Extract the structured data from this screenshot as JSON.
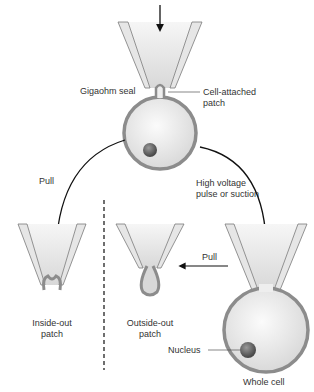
{
  "diagram": {
    "labels": {
      "gigaohm_seal": "Gigaohm seal",
      "cell_attached": [
        "Cell-attached",
        "patch"
      ],
      "pull_left": "Pull",
      "high_voltage": [
        "High voltage",
        "pulse or suction"
      ],
      "pull_middle": "Pull",
      "inside_out": [
        "Inside-out",
        "patch"
      ],
      "outside_out": [
        "Outside-out",
        "patch"
      ],
      "nucleus": "Nucleus",
      "whole_cell": "Whole cell"
    },
    "colors": {
      "glass": "#e2e2e2",
      "glass_edge": "#7a7a7a",
      "membrane": "#8c8c8c",
      "cytoplasm": "#eeeeee",
      "nucleus": "#6a6a6a",
      "arrow": "#111111"
    }
  }
}
